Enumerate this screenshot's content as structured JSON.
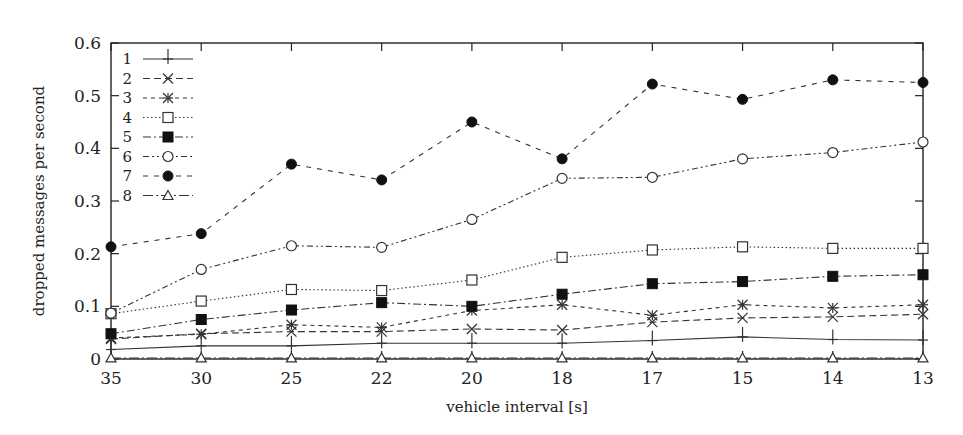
{
  "chart_data": {
    "type": "line",
    "title": "",
    "xlabel": "vehicle interval [s]",
    "ylabel": "dropped messages per second",
    "categories": [
      "35",
      "30",
      "25",
      "22",
      "20",
      "18",
      "17",
      "15",
      "14",
      "13"
    ],
    "ylim": [
      0,
      0.6
    ],
    "yticks": [
      "0",
      "0.1",
      "0.2",
      "0.3",
      "0.4",
      "0.5",
      "0.6"
    ],
    "grid": false,
    "legend_position": "upper-left-inside",
    "series": [
      {
        "name": "1",
        "marker": "plus",
        "dash": "solid",
        "values": [
          0.018,
          0.025,
          0.025,
          0.03,
          0.03,
          0.03,
          0.035,
          0.042,
          0.037,
          0.036
        ]
      },
      {
        "name": "2",
        "marker": "cross",
        "dash": "dashed",
        "values": [
          0.038,
          0.048,
          0.052,
          0.052,
          0.057,
          0.055,
          0.07,
          0.078,
          0.08,
          0.085
        ]
      },
      {
        "name": "3",
        "marker": "star",
        "dash": "short-dashed",
        "values": [
          0.04,
          0.047,
          0.065,
          0.06,
          0.092,
          0.103,
          0.083,
          0.103,
          0.097,
          0.103
        ]
      },
      {
        "name": "4",
        "marker": "open-square",
        "dash": "dotted",
        "values": [
          0.086,
          0.11,
          0.132,
          0.13,
          0.15,
          0.193,
          0.207,
          0.213,
          0.21,
          0.21
        ]
      },
      {
        "name": "5",
        "marker": "filled-square",
        "dash": "dash-dot",
        "values": [
          0.048,
          0.075,
          0.093,
          0.107,
          0.1,
          0.123,
          0.143,
          0.147,
          0.157,
          0.16
        ]
      },
      {
        "name": "6",
        "marker": "open-circle",
        "dash": "dash-dot-dot",
        "values": [
          0.087,
          0.17,
          0.215,
          0.212,
          0.265,
          0.343,
          0.345,
          0.38,
          0.392,
          0.412
        ]
      },
      {
        "name": "7",
        "marker": "filled-circle",
        "dash": "sparse-dashed",
        "values": [
          0.213,
          0.238,
          0.37,
          0.34,
          0.45,
          0.38,
          0.522,
          0.493,
          0.53,
          0.525
        ]
      },
      {
        "name": "8",
        "marker": "open-triangle",
        "dash": "long-dash-dot",
        "values": [
          0.002,
          0.002,
          0.002,
          0.002,
          0.002,
          0.002,
          0.002,
          0.002,
          0.002,
          0.002
        ]
      }
    ]
  },
  "colors": {
    "line": "#333333",
    "axis": "#222222"
  }
}
